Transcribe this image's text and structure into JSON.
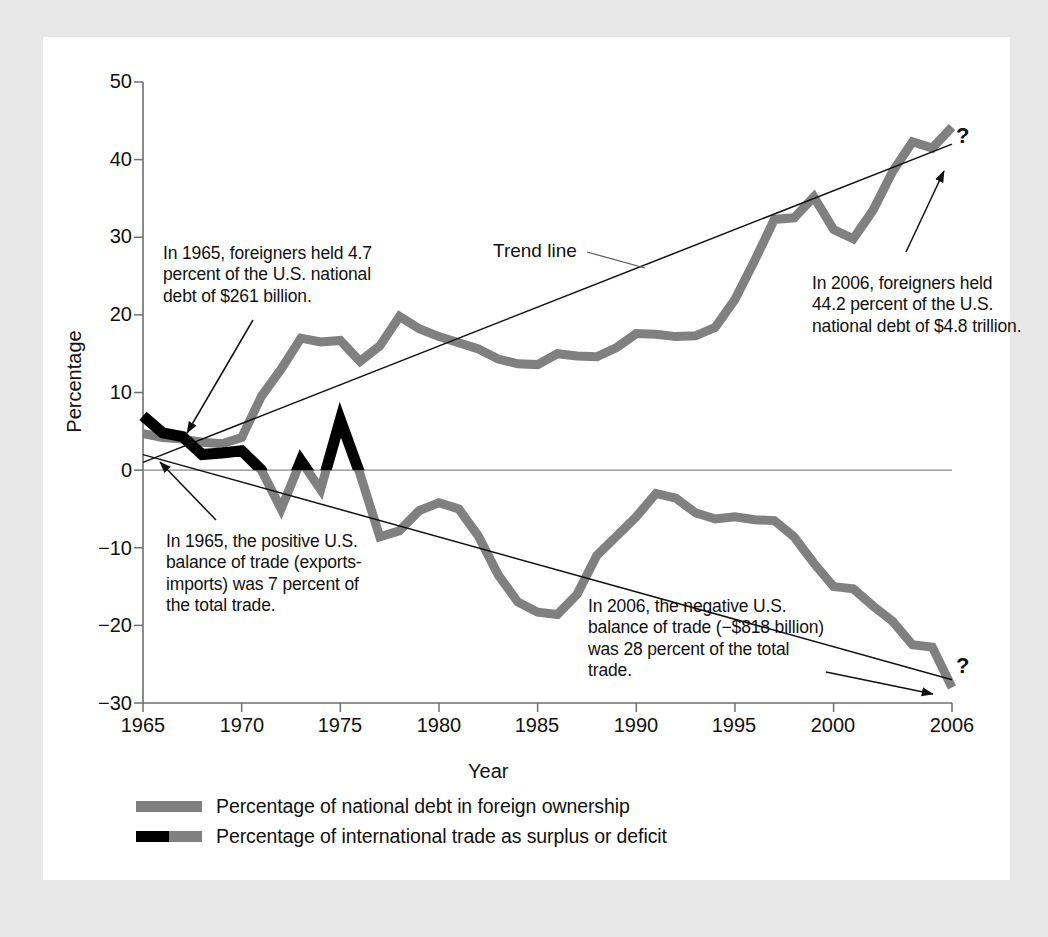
{
  "figure": {
    "background": "#e8e8e8",
    "card_background": "#ffffff",
    "series_gray": "#808080",
    "series_black": "#000000"
  },
  "axis": {
    "ylabel": "Percentage",
    "xlabel": "Year",
    "yticks": [
      "50",
      "40",
      "30",
      "20",
      "10",
      "0",
      "−10",
      "−20",
      "−30"
    ],
    "xticks": [
      "1965",
      "1970",
      "1975",
      "1980",
      "1985",
      "1990",
      "1995",
      "2000",
      "2006"
    ]
  },
  "labels": {
    "trend_line": "Trend line",
    "question_top": "?",
    "question_bottom": "?"
  },
  "annotations": {
    "debt_1965": "In 1965, foreigners held 4.7 percent of the U.S. national debt of $261 billion.",
    "debt_2006": "In 2006, foreigners held 44.2 percent of the U.S. national debt of $4.8 trillion.",
    "trade_1965": "In 1965, the positive U.S. balance of trade (exports-imports) was 7 percent of the total trade.",
    "trade_2006": "In 2006, the negative U.S. balance of trade (−$818 billion) was 28 percent of the total trade."
  },
  "legend": [
    {
      "label": "Percentage of national debt in foreign ownership",
      "swatch": "gray"
    },
    {
      "label": "Percentage of international trade as surplus or deficit",
      "swatch": "black-gray"
    }
  ],
  "chart_data": {
    "type": "line",
    "title": "",
    "xlabel": "Year",
    "ylabel": "Percentage",
    "xlim": [
      1965,
      2006
    ],
    "ylim": [
      -30,
      50
    ],
    "grid": false,
    "legend_position": "bottom-left",
    "x": [
      1965,
      1966,
      1967,
      1968,
      1969,
      1970,
      1971,
      1972,
      1973,
      1974,
      1975,
      1976,
      1977,
      1978,
      1979,
      1980,
      1981,
      1982,
      1983,
      1984,
      1985,
      1986,
      1987,
      1988,
      1989,
      1990,
      1991,
      1992,
      1993,
      1994,
      1995,
      1996,
      1997,
      1998,
      1999,
      2000,
      2001,
      2002,
      2003,
      2004,
      2005,
      2006
    ],
    "series": [
      {
        "name": "Percentage of national debt in foreign ownership",
        "color": "#808080",
        "values": [
          4.7,
          4.2,
          4.0,
          3.6,
          3.4,
          4.2,
          9.5,
          13.0,
          17.0,
          16.5,
          16.7,
          14.0,
          16.0,
          19.8,
          18.2,
          17.2,
          16.4,
          15.6,
          14.3,
          13.7,
          13.6,
          15.0,
          14.7,
          14.6,
          15.8,
          17.6,
          17.5,
          17.2,
          17.3,
          18.4,
          22.0,
          27.0,
          32.3,
          32.5,
          35.2,
          31.0,
          29.8,
          33.5,
          38.5,
          42.3,
          41.5,
          44.2
        ]
      },
      {
        "name": "Percentage of international trade as surplus or deficit",
        "color_positive": "#000000",
        "color_negative": "#808080",
        "values": [
          7.0,
          4.8,
          4.3,
          2.0,
          2.2,
          2.5,
          0.0,
          -5.0,
          1.2,
          -2.5,
          6.5,
          -0.5,
          -8.6,
          -7.8,
          -5.2,
          -4.2,
          -5.0,
          -8.5,
          -13.5,
          -17.0,
          -18.3,
          -18.6,
          -16.0,
          -11.0,
          -8.5,
          -6.0,
          -3.0,
          -3.6,
          -5.5,
          -6.3,
          -6.0,
          -6.4,
          -6.5,
          -8.6,
          -12.0,
          -15.0,
          -15.3,
          -17.5,
          -19.5,
          -22.5,
          -22.8,
          -28.0
        ]
      }
    ],
    "trend_lines": [
      {
        "name": "debt-trend",
        "from": [
          1965,
          1.0
        ],
        "to": [
          2006,
          42.0
        ]
      },
      {
        "name": "trade-trend",
        "from": [
          1965,
          2.0
        ],
        "to": [
          2006,
          -27.0
        ]
      }
    ]
  }
}
